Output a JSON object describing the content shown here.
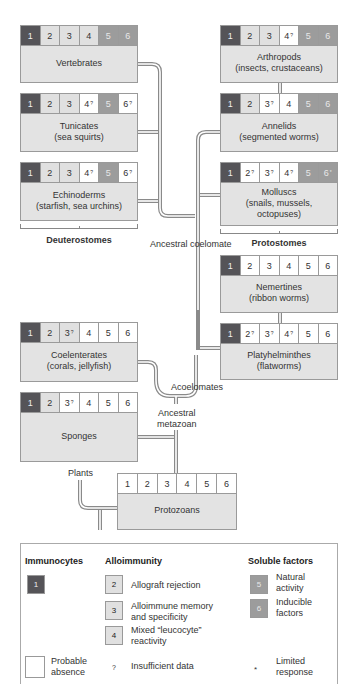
{
  "colors": {
    "immunocytes": "#555458",
    "alloimmunity": "#e0e0e0",
    "soluble_factors": "#9c9c9c",
    "probable_absence": "#ffffff",
    "taxon_body": "#e3e3e3",
    "line": "#8a8a8a"
  },
  "taxa": {
    "vertebrates": {
      "name": "Vertebrates",
      "sub": "",
      "cells": [
        {
          "n": "1",
          "m": "",
          "t": "dark"
        },
        {
          "n": "2",
          "m": "",
          "t": "light"
        },
        {
          "n": "3",
          "m": "",
          "t": "light"
        },
        {
          "n": "4",
          "m": "",
          "t": "light"
        },
        {
          "n": "5",
          "m": "",
          "t": "mid"
        },
        {
          "n": "6",
          "m": "",
          "t": "mid"
        }
      ]
    },
    "tunicates": {
      "name": "Tunicates",
      "sub": "(sea squirts)",
      "cells": [
        {
          "n": "1",
          "m": "",
          "t": "dark"
        },
        {
          "n": "2",
          "m": "",
          "t": "light"
        },
        {
          "n": "3",
          "m": "",
          "t": "light"
        },
        {
          "n": "4",
          "m": "?",
          "t": "white"
        },
        {
          "n": "5",
          "m": "",
          "t": "mid"
        },
        {
          "n": "6",
          "m": "?",
          "t": "white"
        }
      ]
    },
    "echinoderms": {
      "name": "Echinoderms",
      "sub": "(starfish, sea urchins)",
      "cells": [
        {
          "n": "1",
          "m": "",
          "t": "dark"
        },
        {
          "n": "2",
          "m": "",
          "t": "light"
        },
        {
          "n": "3",
          "m": "",
          "t": "light"
        },
        {
          "n": "4",
          "m": "?",
          "t": "white"
        },
        {
          "n": "5",
          "m": "",
          "t": "mid"
        },
        {
          "n": "6",
          "m": "?",
          "t": "white"
        }
      ]
    },
    "arthropods": {
      "name": "Arthropods",
      "sub": "(insects, crustaceans)",
      "cells": [
        {
          "n": "1",
          "m": "",
          "t": "dark"
        },
        {
          "n": "2",
          "m": "",
          "t": "light"
        },
        {
          "n": "3",
          "m": "",
          "t": "light"
        },
        {
          "n": "4",
          "m": "?",
          "t": "white"
        },
        {
          "n": "5",
          "m": "",
          "t": "mid"
        },
        {
          "n": "6",
          "m": "",
          "t": "mid"
        }
      ]
    },
    "annelids": {
      "name": "Annelids",
      "sub": "(segmented worms)",
      "cells": [
        {
          "n": "1",
          "m": "",
          "t": "dark"
        },
        {
          "n": "2",
          "m": "",
          "t": "light"
        },
        {
          "n": "3",
          "m": "?",
          "t": "white"
        },
        {
          "n": "4",
          "m": "",
          "t": "white"
        },
        {
          "n": "5",
          "m": "",
          "t": "mid"
        },
        {
          "n": "6",
          "m": "",
          "t": "mid"
        }
      ]
    },
    "molluscs": {
      "name": "Molluscs",
      "sub": "(snails, mussels, octopuses)",
      "cells": [
        {
          "n": "1",
          "m": "",
          "t": "dark"
        },
        {
          "n": "2",
          "m": "?",
          "t": "white"
        },
        {
          "n": "3",
          "m": "?",
          "t": "white"
        },
        {
          "n": "4",
          "m": "?",
          "t": "white"
        },
        {
          "n": "5",
          "m": "",
          "t": "mid"
        },
        {
          "n": "6",
          "m": "*",
          "t": "mid"
        }
      ]
    },
    "nemertines": {
      "name": "Nemertines",
      "sub": "(ribbon worms)",
      "cells": [
        {
          "n": "1",
          "m": "",
          "t": "dark"
        },
        {
          "n": "2",
          "m": "",
          "t": "white"
        },
        {
          "n": "3",
          "m": "",
          "t": "white"
        },
        {
          "n": "4",
          "m": "",
          "t": "white"
        },
        {
          "n": "5",
          "m": "",
          "t": "white"
        },
        {
          "n": "6",
          "m": "",
          "t": "white"
        }
      ]
    },
    "platyhelminthes": {
      "name": "Platyhelminthes",
      "sub": "(flatworms)",
      "cells": [
        {
          "n": "1",
          "m": "",
          "t": "dark"
        },
        {
          "n": "2",
          "m": "?",
          "t": "white"
        },
        {
          "n": "3",
          "m": "?",
          "t": "white"
        },
        {
          "n": "4",
          "m": "?",
          "t": "white"
        },
        {
          "n": "5",
          "m": "",
          "t": "white"
        },
        {
          "n": "6",
          "m": "",
          "t": "white"
        }
      ]
    },
    "coelenterates": {
      "name": "Coelenterates",
      "sub": "(corals, jellyfish)",
      "cells": [
        {
          "n": "1",
          "m": "",
          "t": "dark"
        },
        {
          "n": "2",
          "m": "",
          "t": "light"
        },
        {
          "n": "3",
          "m": "?",
          "t": "light"
        },
        {
          "n": "4",
          "m": "",
          "t": "white"
        },
        {
          "n": "5",
          "m": "",
          "t": "white"
        },
        {
          "n": "6",
          "m": "",
          "t": "white"
        }
      ]
    },
    "sponges": {
      "name": "Sponges",
      "sub": "",
      "cells": [
        {
          "n": "1",
          "m": "",
          "t": "dark"
        },
        {
          "n": "2",
          "m": "",
          "t": "light"
        },
        {
          "n": "3",
          "m": "?",
          "t": "white"
        },
        {
          "n": "4",
          "m": "",
          "t": "white"
        },
        {
          "n": "5",
          "m": "",
          "t": "white"
        },
        {
          "n": "6",
          "m": "",
          "t": "white"
        }
      ]
    },
    "protozoans": {
      "name": "Protozoans",
      "sub": "",
      "cells": [
        {
          "n": "1",
          "m": "",
          "t": "white"
        },
        {
          "n": "2",
          "m": "",
          "t": "white"
        },
        {
          "n": "3",
          "m": "",
          "t": "white"
        },
        {
          "n": "4",
          "m": "",
          "t": "white"
        },
        {
          "n": "5",
          "m": "",
          "t": "white"
        },
        {
          "n": "6",
          "m": "",
          "t": "white"
        }
      ]
    }
  },
  "labels": {
    "deuterostomes": "Deuterostomes",
    "protostomes": "Protostomes",
    "ancestral_coelomate": "Ancestral coelomate",
    "acoelomates": "Acoelomates",
    "ancestral_metazoan_1": "Ancestral",
    "ancestral_metazoan_2": "metazoan",
    "plants": "Plants"
  },
  "legend": {
    "immunocytes": {
      "heading": "Immunocytes",
      "swatch": "1"
    },
    "alloimmunity": {
      "heading": "Alloimmunity",
      "items": [
        {
          "swatch": "2",
          "text1": "Allograft rejection",
          "text2": ""
        },
        {
          "swatch": "3",
          "text1": "Alloimmune memory",
          "text2": "and specificity"
        },
        {
          "swatch": "4",
          "text1": "Mixed “leucocyte”",
          "text2": "reactivity"
        }
      ]
    },
    "soluble_factors": {
      "heading": "Soluble factors",
      "items": [
        {
          "swatch": "5",
          "text1": "Natural",
          "text2": "activity"
        },
        {
          "swatch": "6",
          "text1": "Inducible",
          "text2": "factors"
        }
      ]
    },
    "probable_absence": {
      "text1": "Probable",
      "text2": "absence"
    },
    "insufficient_data": {
      "symbol": "?",
      "text": "Insufficient data"
    },
    "limited_response": {
      "symbol": "*",
      "text1": "Limited",
      "text2": "response"
    }
  }
}
